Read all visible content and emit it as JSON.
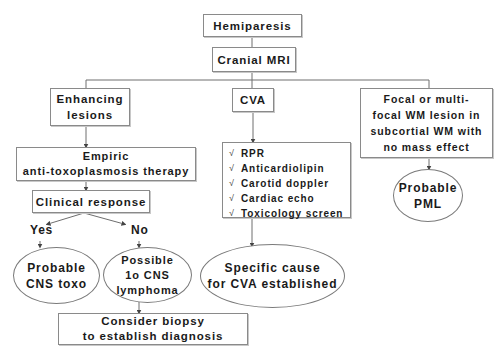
{
  "diagram": {
    "type": "flowchart",
    "nodes": {
      "hemiparesis": {
        "label": "Hemiparesis"
      },
      "cranial_mri": {
        "label": "Cranial MRI"
      },
      "enhancing_lesions": {
        "lines": [
          "Enhancing",
          "lesions"
        ]
      },
      "cva": {
        "label": "CVA"
      },
      "focal_wm_lesion": {
        "lines": [
          "Focal or multi-",
          "focal WM lesion in",
          "subcortial WM with",
          "no mass effect"
        ]
      },
      "empiric_therapy": {
        "lines": [
          "Empiric",
          "anti-toxoplasmosis therapy"
        ]
      },
      "clinical_response": {
        "label": "Clinical response"
      },
      "cva_workup": {
        "check_icon": "√",
        "items": [
          "RPR",
          "Anticardiolipin",
          "Carotid doppler",
          "Cardiac echo",
          "Toxicology screen"
        ]
      },
      "probable_cns_toxo": {
        "lines": [
          "Probable",
          "CNS toxo"
        ]
      },
      "possible_cns_lymphoma": {
        "lines": [
          "Possible",
          "1o CNS",
          "lymphoma"
        ]
      },
      "specific_cause_cva": {
        "lines": [
          "Specific cause",
          "for CVA established"
        ]
      },
      "probable_pml": {
        "lines": [
          "Probable",
          "PML"
        ]
      },
      "consider_biopsy": {
        "lines": [
          "Consider biopsy",
          "to establish diagnosis"
        ]
      }
    },
    "edge_labels": {
      "yes": "Yes",
      "no": "No"
    },
    "edges": [
      [
        "hemiparesis",
        "cranial_mri"
      ],
      [
        "cranial_mri",
        "enhancing_lesions"
      ],
      [
        "cranial_mri",
        "cva"
      ],
      [
        "cranial_mri",
        "focal_wm_lesion"
      ],
      [
        "enhancing_lesions",
        "empiric_therapy"
      ],
      [
        "empiric_therapy",
        "clinical_response"
      ],
      [
        "clinical_response",
        "probable_cns_toxo",
        "Yes"
      ],
      [
        "clinical_response",
        "possible_cns_lymphoma",
        "No"
      ],
      [
        "possible_cns_lymphoma",
        "consider_biopsy"
      ],
      [
        "cva",
        "cva_workup"
      ],
      [
        "cva_workup",
        "specific_cause_cva"
      ],
      [
        "focal_wm_lesion",
        "probable_pml"
      ]
    ],
    "colors": {
      "line": "#6e6e6e",
      "border": "#8a8a8a",
      "text": "#1a1a1a",
      "background": "#ffffff"
    }
  }
}
